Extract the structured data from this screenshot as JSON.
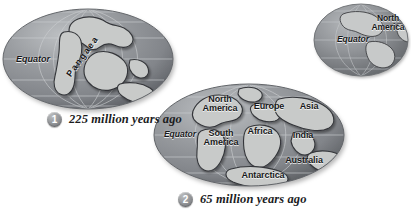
{
  "figure": {
    "type": "continental-drift-diagram",
    "background_color": "#ffffff",
    "ocean_color": "#8d9094",
    "land_color": "#c9cbcb",
    "grid_color": "#c6c9cc",
    "outline_color": "#3b3d40",
    "label_color": "#17181a"
  },
  "globes": [
    {
      "id": "globe-pangaea",
      "step": "1",
      "caption": "225 million years ago",
      "labels": [
        {
          "name": "equator",
          "text": "Equator"
        },
        {
          "name": "pangaea",
          "text": "Pangaea"
        }
      ]
    },
    {
      "id": "globe-separated",
      "step": "2",
      "caption": "65 million years ago",
      "labels": [
        {
          "name": "north-america",
          "text": "North\nAmerica"
        },
        {
          "name": "europe",
          "text": "Europe"
        },
        {
          "name": "asia",
          "text": "Asia"
        },
        {
          "name": "equator",
          "text": "Equator"
        },
        {
          "name": "south-america",
          "text": "South\nAmerica"
        },
        {
          "name": "africa",
          "text": "Africa"
        },
        {
          "name": "india",
          "text": "India"
        },
        {
          "name": "australia",
          "text": "Australia"
        },
        {
          "name": "antarctica",
          "text": "Antarctica"
        }
      ]
    },
    {
      "id": "globe-present",
      "step": "",
      "caption": "",
      "labels": [
        {
          "name": "north-america",
          "text": "North\nAmerica"
        },
        {
          "name": "equator",
          "text": "Equator"
        }
      ]
    }
  ],
  "globe1": {
    "equator": "Equator",
    "pangaea": "Pangaea",
    "step": "1",
    "caption": "225 million years ago"
  },
  "globe2": {
    "north_america": "North\nAmerica",
    "europe": "Europe",
    "asia": "Asia",
    "equator": "Equator",
    "south_america": "South\nAmerica",
    "africa": "Africa",
    "india": "India",
    "australia": "Australia",
    "antarctica": "Antarctica",
    "step": "2",
    "caption": "65 million years ago"
  },
  "globe3": {
    "north_america": "North\nAmerica",
    "equator": "Equator"
  }
}
